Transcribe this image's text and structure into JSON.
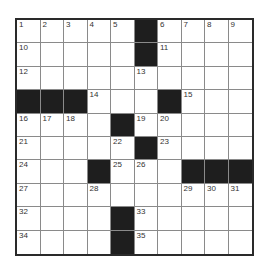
{
  "puzzle": {
    "rows": 10,
    "cols": 10,
    "colors": {
      "block": "#1e1e1e",
      "cell": "#ffffff",
      "border": "#2a2a2a",
      "gridline": "#8a8a8a",
      "number": "#333333"
    },
    "grid": [
      [
        "1",
        "2",
        "3",
        "4",
        "5",
        "#",
        "6",
        "7",
        "8",
        "9"
      ],
      [
        "10",
        "",
        "",
        "",
        "",
        "#",
        "11",
        "",
        "",
        ""
      ],
      [
        "12",
        "",
        "",
        "",
        "",
        "13",
        "",
        "",
        "",
        ""
      ],
      [
        "#",
        "#",
        "#",
        "14",
        "",
        "",
        "#",
        "15",
        "",
        ""
      ],
      [
        "16",
        "17",
        "18",
        "",
        "#",
        "19",
        "20",
        "",
        "",
        ""
      ],
      [
        "21",
        "",
        "",
        "",
        "22",
        "#",
        "23",
        "",
        "",
        ""
      ],
      [
        "24",
        "",
        "",
        "#",
        "25",
        "26",
        "",
        "#",
        "#",
        "#"
      ],
      [
        "27",
        "",
        "",
        "28",
        "",
        "",
        "",
        "29",
        "30",
        "31"
      ],
      [
        "32",
        "",
        "",
        "",
        "#",
        "33",
        "",
        "",
        "",
        ""
      ],
      [
        "34",
        "",
        "",
        "",
        "#",
        "35",
        "",
        "",
        "",
        ""
      ]
    ],
    "numbers": [
      "1",
      "2",
      "3",
      "4",
      "5",
      "6",
      "7",
      "8",
      "9",
      "10",
      "11",
      "12",
      "13",
      "14",
      "15",
      "16",
      "17",
      "18",
      "19",
      "20",
      "21",
      "22",
      "23",
      "24",
      "25",
      "26",
      "27",
      "28",
      "29",
      "30",
      "31",
      "32",
      "33",
      "34",
      "35"
    ]
  }
}
